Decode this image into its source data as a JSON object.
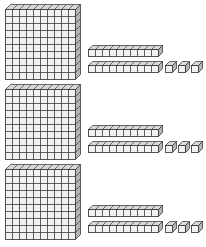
{
  "figure": {
    "title": "Base-ten blocks place value model",
    "type": "base-ten-blocks",
    "background_color": "#ffffff",
    "rows_count": 3,
    "row_labels": [
      "row-1",
      "row-2",
      "row-3"
    ]
  },
  "palette": {
    "cell_fill": "#f2f2f2",
    "grid_line": "#3a3a3a",
    "top_face_fill": "#d8d8d8",
    "side_face_fill": "#b4b4b4",
    "outline": "#2b2b2b",
    "background": "#ffffff"
  },
  "geometry": {
    "flat": {
      "columns": 10,
      "rows": 10,
      "cell_size_px": 7,
      "depth_px": 5,
      "face_width_px": 70,
      "face_height_px": 70
    },
    "rod": {
      "segments": 10,
      "segment_size_px": 7,
      "depth_px": 4,
      "face_width_px": 70,
      "face_height_px": 7
    },
    "cube": {
      "segments": 1,
      "size_px": 7,
      "depth_px": 4
    }
  },
  "rows": [
    {
      "name": "row-1",
      "top_px": 4,
      "value_label": "123",
      "hundreds": {
        "count": 1,
        "label": "hundred-flat",
        "value": 100,
        "items": [
          {
            "left_px": 5,
            "top_px": 0
          }
        ]
      },
      "tens": {
        "count": 2,
        "label": "ten-rod",
        "value": 10,
        "items": [
          {
            "left_px": 88,
            "top_px": 41
          },
          {
            "left_px": 88,
            "top_px": 57
          }
        ]
      },
      "ones": {
        "count": 3,
        "label": "unit-cube",
        "value": 1,
        "items": [
          {
            "left_px": 165,
            "top_px": 57
          },
          {
            "left_px": 178,
            "top_px": 57
          },
          {
            "left_px": 191,
            "top_px": 57
          }
        ]
      }
    },
    {
      "name": "row-2",
      "top_px": 84,
      "value_label": "123",
      "hundreds": {
        "count": 1,
        "label": "hundred-flat",
        "value": 100,
        "items": [
          {
            "left_px": 5,
            "top_px": 0
          }
        ]
      },
      "tens": {
        "count": 2,
        "label": "ten-rod",
        "value": 10,
        "items": [
          {
            "left_px": 88,
            "top_px": 41
          },
          {
            "left_px": 88,
            "top_px": 57
          }
        ]
      },
      "ones": {
        "count": 3,
        "label": "unit-cube",
        "value": 1,
        "items": [
          {
            "left_px": 165,
            "top_px": 57
          },
          {
            "left_px": 178,
            "top_px": 57
          },
          {
            "left_px": 191,
            "top_px": 57
          }
        ]
      }
    },
    {
      "name": "row-3",
      "top_px": 164,
      "value_label": "123",
      "hundreds": {
        "count": 1,
        "label": "hundred-flat",
        "value": 100,
        "items": [
          {
            "left_px": 5,
            "top_px": 0
          }
        ]
      },
      "tens": {
        "count": 2,
        "label": "ten-rod",
        "value": 10,
        "items": [
          {
            "left_px": 88,
            "top_px": 41
          },
          {
            "left_px": 88,
            "top_px": 57
          }
        ]
      },
      "ones": {
        "count": 3,
        "label": "unit-cube",
        "value": 1,
        "items": [
          {
            "left_px": 165,
            "top_px": 57
          },
          {
            "left_px": 178,
            "top_px": 57
          },
          {
            "left_px": 191,
            "top_px": 57
          }
        ]
      }
    }
  ]
}
